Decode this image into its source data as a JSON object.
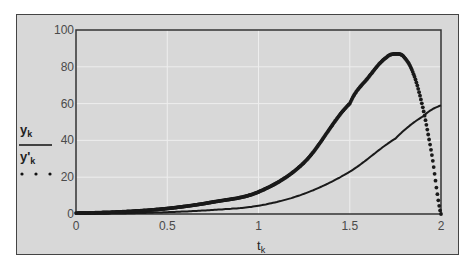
{
  "chart_data": {
    "type": "line",
    "title": "",
    "xlabel": "t_k",
    "ylabel": "",
    "xlim": [
      0,
      2
    ],
    "ylim": [
      0,
      100
    ],
    "x_ticks": [
      "0",
      "0.5",
      "1",
      "1.5",
      "2"
    ],
    "y_ticks": [
      "0",
      "20",
      "40",
      "60",
      "80",
      "100"
    ],
    "grid": true,
    "legend": [
      {
        "label": "y_k",
        "style": "solid"
      },
      {
        "label": "y'_k",
        "style": "dotted"
      }
    ],
    "legend_position": "left",
    "series": [
      {
        "name": "y_k",
        "style": "solid-thin",
        "x": [
          0,
          0.25,
          0.5,
          0.75,
          1.0,
          1.25,
          1.5,
          1.75,
          1.9,
          2.0
        ],
        "values": [
          0,
          0.3,
          1,
          2.2,
          4.5,
          11,
          23,
          41,
          53,
          59
        ]
      },
      {
        "name": "y'_k",
        "style": "dotted-dense",
        "x": [
          0,
          0.25,
          0.5,
          0.75,
          1.0,
          1.25,
          1.5,
          1.6,
          1.7,
          1.76,
          1.8,
          1.85,
          1.9,
          1.95,
          2.0
        ],
        "values": [
          0.5,
          1.2,
          3,
          6.5,
          12,
          28,
          60,
          74,
          85,
          87,
          85,
          76,
          58,
          32,
          0
        ]
      }
    ]
  },
  "legend": {
    "series1_label": "y",
    "series1_sub": "k",
    "series2_label": "y'",
    "series2_sub": "k"
  },
  "axis": {
    "xlabel_main": "t",
    "xlabel_sub": "k"
  }
}
